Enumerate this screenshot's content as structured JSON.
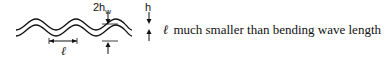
{
  "diagram": {
    "labels": {
      "wall_thickness": "2h",
      "wall_thickness_subscript": "w",
      "amplitude": "h",
      "wavelength": "ℓ"
    },
    "caption": {
      "symbol": "ℓ",
      "text": "much smaller than bending wave length"
    },
    "colors": {
      "stroke": "#111111",
      "background": "#ffffff"
    }
  }
}
